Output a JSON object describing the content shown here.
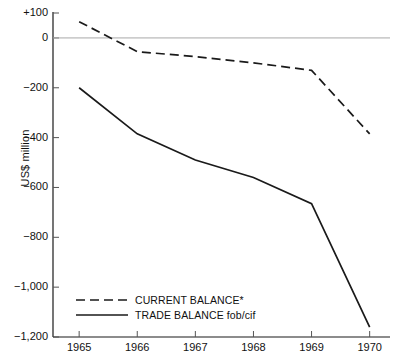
{
  "chart_data": {
    "type": "line",
    "title": "",
    "xlabel": "",
    "ylabel": "US$ million",
    "x": [
      1965,
      1966,
      1967,
      1968,
      1969,
      1970
    ],
    "xtick_labels": [
      "1965",
      "1966",
      "1967",
      "1968",
      "1969",
      "1970"
    ],
    "ytick_values": [
      100,
      0,
      -200,
      -400,
      -600,
      -800,
      -1000,
      -1200
    ],
    "ytick_labels": [
      "+100",
      "0",
      "−200",
      "−400",
      "−600",
      "−800",
      "−1,000",
      "−1,200"
    ],
    "ylim": [
      -1200,
      100
    ],
    "xlim": [
      1964.55,
      1970.35
    ],
    "grid": false,
    "zero_line": true,
    "legend_position": "bottom-left",
    "series": [
      {
        "name": "CURRENT BALANCE*",
        "style": "dashed",
        "color": "#1a1a1a",
        "values": [
          65,
          -55,
          -75,
          -100,
          -130,
          -385
        ]
      },
      {
        "name": "TRADE BALANCE fob/cif",
        "style": "solid",
        "color": "#1a1a1a",
        "values": [
          -200,
          -385,
          -490,
          -560,
          -665,
          -1160
        ]
      }
    ]
  },
  "axis": {
    "y_title": "US$ million"
  },
  "legend": {
    "entries": [
      {
        "label": "CURRENT BALANCE*"
      },
      {
        "label": "TRADE BALANCE fob/cif"
      }
    ]
  }
}
